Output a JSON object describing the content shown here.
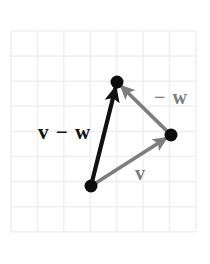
{
  "figure": {
    "background_color": "#ffffff",
    "canvas": {
      "width": 210,
      "height": 264
    }
  },
  "grid": {
    "line_color": "#f0f0f0",
    "x_start": 11,
    "y_start": 31,
    "cell_width": 26.4,
    "cell_height": 25.1,
    "columns": 7,
    "rows": 8
  },
  "points": [
    {
      "name": "origin-point",
      "x": 91,
      "y": 186,
      "radius": 6.5,
      "color": "#0d0d0d"
    },
    {
      "name": "head-v-minus-w-point",
      "x": 117,
      "y": 82,
      "radius": 6.5,
      "color": "#0d0d0d"
    },
    {
      "name": "head-v-point",
      "x": 171,
      "y": 135,
      "radius": 6.5,
      "color": "#0d0d0d"
    }
  ],
  "vectors": [
    {
      "name": "v-minus-w-arrow",
      "label": "v − w",
      "color": "#111111",
      "width": 4.2,
      "from": {
        "x": 91,
        "y": 186
      },
      "to": {
        "x": 117,
        "y": 82
      }
    },
    {
      "name": "v-arrow",
      "label": "v",
      "color": "#7d7d7d",
      "width": 3.6,
      "from": {
        "x": 91,
        "y": 186
      },
      "to": {
        "x": 171,
        "y": 135
      }
    },
    {
      "name": "minus-w-arrow",
      "label": "− w",
      "color": "#7d7d7d",
      "width": 3.6,
      "from": {
        "x": 171,
        "y": 135
      },
      "to": {
        "x": 117,
        "y": 82
      }
    }
  ],
  "labels": {
    "v_minus_w": "v − w",
    "minus_w": "− w",
    "v": "v"
  },
  "colors": {
    "black": "#111111",
    "gray": "#7d7d7d",
    "grid": "#f0f0f0",
    "dot": "#0d0d0d"
  }
}
